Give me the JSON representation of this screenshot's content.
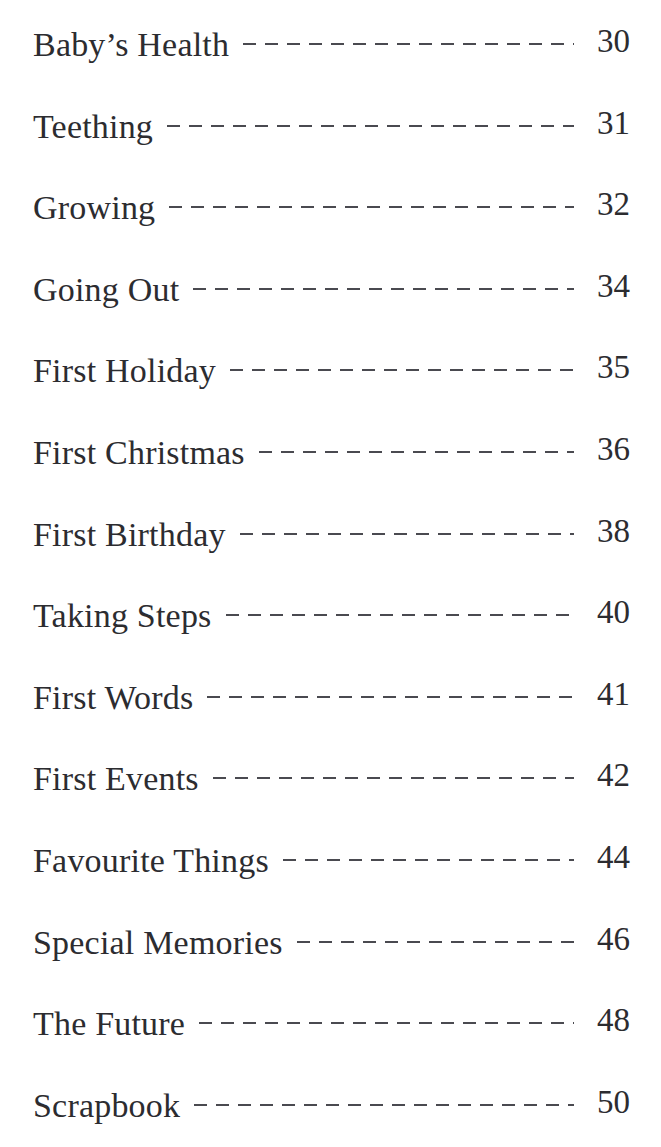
{
  "page": {
    "type": "table-of-contents",
    "background_color": "#ffffff",
    "text_color": "#2c2c30",
    "leader_color": "#4a4a50",
    "leader_style": "dashed"
  },
  "contents": {
    "entries": [
      {
        "title": "Baby’s Health",
        "page": "30"
      },
      {
        "title": "Teething",
        "page": "31"
      },
      {
        "title": "Growing",
        "page": "32"
      },
      {
        "title": "Going Out",
        "page": "34"
      },
      {
        "title": "First Holiday",
        "page": "35"
      },
      {
        "title": "First Christmas",
        "page": "36"
      },
      {
        "title": "First Birthday",
        "page": "38"
      },
      {
        "title": "Taking Steps",
        "page": "40"
      },
      {
        "title": "First Words",
        "page": "41"
      },
      {
        "title": "First Events",
        "page": "42"
      },
      {
        "title": "Favourite Things",
        "page": "44"
      },
      {
        "title": "Special Memories",
        "page": "46"
      },
      {
        "title": "The Future",
        "page": "48"
      },
      {
        "title": "Scrapbook",
        "page": "50"
      }
    ]
  }
}
